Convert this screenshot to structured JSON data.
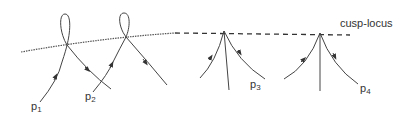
{
  "diagram": {
    "locus_label": "cusp-locus",
    "points": [
      {
        "name": "p",
        "sub": "1"
      },
      {
        "name": "p",
        "sub": "2"
      },
      {
        "name": "p",
        "sub": "3"
      },
      {
        "name": "p",
        "sub": "4"
      }
    ],
    "colors": {
      "stroke": "#444444",
      "text": "#333333",
      "background": "#ffffff"
    }
  }
}
